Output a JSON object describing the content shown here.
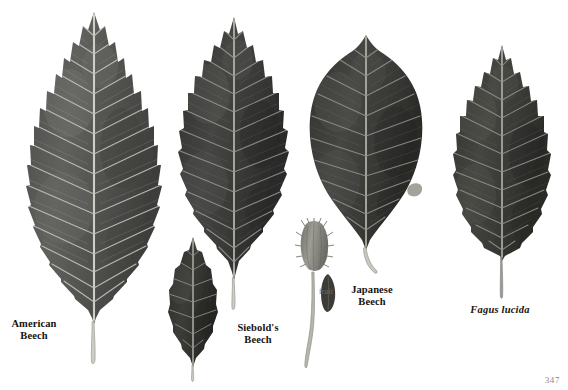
{
  "page": {
    "kind": "botanical-plate",
    "background_color": "#ffffff",
    "page_number": "347"
  },
  "specimens": [
    {
      "id": "american-beech",
      "label": "American\nBeech",
      "label_style": "bold",
      "common_name": "American Beech",
      "leaf_shape": "elliptic, acuminate tip, coarsely toothed margin",
      "margin": "toothed",
      "tone": "#5a5a58",
      "vein_color": "#b9b8b2",
      "vein_pairs": 15,
      "petiole": "long, pale",
      "label_x": 5,
      "label_y": 318,
      "label_w": 58
    },
    {
      "id": "siebolds-beech",
      "label": "Siebold's\nBeech",
      "label_style": "bold",
      "common_name": "Siebold's Beech",
      "leaf_shape": "ovate, acuminate tip, shallowly toothed wavy margin",
      "margin": "wavy-toothed",
      "tone": "#3c3c3b",
      "vein_color": "#8e8d88",
      "vein_pairs": 12,
      "petiole": "short, pale",
      "label_x": 228,
      "label_y": 322,
      "label_w": 60
    },
    {
      "id": "siebolds-beech-small-leaf",
      "label": "",
      "label_style": "none",
      "common_name": "Siebold's Beech (small leaf)",
      "leaf_shape": "small ovate leaf",
      "margin": "entire-wavy",
      "tone": "#35352f",
      "vein_color": "#8a8a82",
      "vein_pairs": 9,
      "petiole": "short, pale"
    },
    {
      "id": "fruit",
      "label": "fruit",
      "label_style": "small",
      "common_name": "fruit",
      "description": "beech cupule with bristly bracts on long slender stalk, plus detached nut",
      "tone": "#8e8c86",
      "nut_tone": "#3f3e39",
      "label_x": 313,
      "label_y": 288,
      "label_w": 26
    },
    {
      "id": "japanese-beech",
      "label": "Japanese\nBeech",
      "label_style": "bold",
      "common_name": "Japanese Beech",
      "leaf_shape": "broadly ovate, short acuminate tip, entire wavy margin",
      "margin": "entire-wavy",
      "tone": "#3a3a38",
      "vein_color": "#8c8b85",
      "vein_pairs": 11,
      "petiole": "short, curved",
      "label_x": 341,
      "label_y": 284,
      "label_w": 62
    },
    {
      "id": "fagus-lucida",
      "label": "Fagus lucida",
      "label_style": "bold-italic",
      "common_name": "Fagus lucida",
      "leaf_shape": "elliptic-ovate, toothed margin, long petiole",
      "margin": "toothed",
      "tone": "#3b3a36",
      "vein_color": "#8d8c86",
      "vein_pairs": 13,
      "petiole": "long, straight",
      "label_x": 463,
      "label_y": 304,
      "label_w": 74
    }
  ]
}
